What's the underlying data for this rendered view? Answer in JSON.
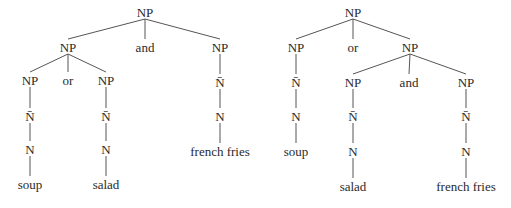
{
  "diagram": {
    "type": "syntax-tree-pair",
    "colors": {
      "text": "#2a2a2a",
      "line": "#555555",
      "background": "#ffffff"
    },
    "trees": [
      {
        "name": "tree-left",
        "nodes": [
          {
            "id": "L0",
            "label": "NP",
            "x": 145,
            "y": 14
          },
          {
            "id": "L1",
            "label": "NP",
            "x": 68,
            "y": 49
          },
          {
            "id": "L2",
            "label": "and",
            "x": 145,
            "y": 49
          },
          {
            "id": "L3",
            "label": "NP",
            "x": 220,
            "y": 49
          },
          {
            "id": "L4",
            "label": "NP",
            "x": 30,
            "y": 82
          },
          {
            "id": "L5",
            "label": "or",
            "x": 68,
            "y": 82
          },
          {
            "id": "L6",
            "label": "NP",
            "x": 106,
            "y": 82
          },
          {
            "id": "L7",
            "label": "N̄",
            "x": 30,
            "y": 118
          },
          {
            "id": "L8",
            "label": "N",
            "x": 30,
            "y": 151
          },
          {
            "id": "L9",
            "label": "soup",
            "x": 30,
            "y": 186
          },
          {
            "id": "L10",
            "label": "N̄",
            "x": 106,
            "y": 118
          },
          {
            "id": "L11",
            "label": "N",
            "x": 106,
            "y": 151
          },
          {
            "id": "L12",
            "label": "salad",
            "x": 106,
            "y": 186
          },
          {
            "id": "L13",
            "label": "N̄",
            "x": 220,
            "y": 84
          },
          {
            "id": "L14",
            "label": "N",
            "x": 220,
            "y": 118
          },
          {
            "id": "L15",
            "label": "french fries",
            "x": 220,
            "y": 153
          }
        ],
        "edges": [
          [
            "L0",
            "L1"
          ],
          [
            "L0",
            "L2"
          ],
          [
            "L0",
            "L3"
          ],
          [
            "L1",
            "L4"
          ],
          [
            "L1",
            "L5"
          ],
          [
            "L1",
            "L6"
          ],
          [
            "L4",
            "L7"
          ],
          [
            "L7",
            "L8"
          ],
          [
            "L8",
            "L9"
          ],
          [
            "L6",
            "L10"
          ],
          [
            "L10",
            "L11"
          ],
          [
            "L11",
            "L12"
          ],
          [
            "L3",
            "L13"
          ],
          [
            "L13",
            "L14"
          ],
          [
            "L14",
            "L15"
          ]
        ]
      },
      {
        "name": "tree-right",
        "nodes": [
          {
            "id": "R0",
            "label": "NP",
            "x": 353,
            "y": 14
          },
          {
            "id": "R1",
            "label": "NP",
            "x": 296,
            "y": 49
          },
          {
            "id": "R2",
            "label": "or",
            "x": 353,
            "y": 49
          },
          {
            "id": "R3",
            "label": "NP",
            "x": 410,
            "y": 49
          },
          {
            "id": "R4",
            "label": "N̄",
            "x": 296,
            "y": 84
          },
          {
            "id": "R5",
            "label": "N",
            "x": 296,
            "y": 118
          },
          {
            "id": "R6",
            "label": "soup",
            "x": 296,
            "y": 153
          },
          {
            "id": "R7",
            "label": "NP",
            "x": 353,
            "y": 84
          },
          {
            "id": "R8",
            "label": "and",
            "x": 409,
            "y": 84
          },
          {
            "id": "R9",
            "label": "NP",
            "x": 466,
            "y": 84
          },
          {
            "id": "R10",
            "label": "N̄",
            "x": 353,
            "y": 118
          },
          {
            "id": "R11",
            "label": "N",
            "x": 353,
            "y": 153
          },
          {
            "id": "R12",
            "label": "salad",
            "x": 353,
            "y": 188
          },
          {
            "id": "R13",
            "label": "N̄",
            "x": 466,
            "y": 118
          },
          {
            "id": "R14",
            "label": "N",
            "x": 466,
            "y": 153
          },
          {
            "id": "R15",
            "label": "french fries",
            "x": 466,
            "y": 188
          }
        ],
        "edges": [
          [
            "R0",
            "R1"
          ],
          [
            "R0",
            "R2"
          ],
          [
            "R0",
            "R3"
          ],
          [
            "R1",
            "R4"
          ],
          [
            "R4",
            "R5"
          ],
          [
            "R5",
            "R6"
          ],
          [
            "R3",
            "R7"
          ],
          [
            "R3",
            "R8"
          ],
          [
            "R3",
            "R9"
          ],
          [
            "R7",
            "R10"
          ],
          [
            "R10",
            "R11"
          ],
          [
            "R11",
            "R12"
          ],
          [
            "R9",
            "R13"
          ],
          [
            "R13",
            "R14"
          ],
          [
            "R14",
            "R15"
          ]
        ]
      }
    ]
  }
}
